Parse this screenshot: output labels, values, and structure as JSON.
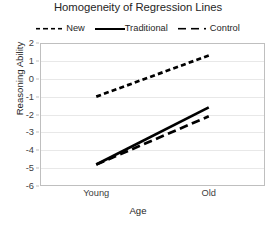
{
  "chart_data": {
    "type": "line",
    "title": "Homogeneity of Regression Lines",
    "xlabel": "Age",
    "ylabel": "Reasoning Ability",
    "categories": [
      "Young",
      "Old"
    ],
    "ylim": [
      -6,
      2
    ],
    "ytick_labels": [
      "2",
      "1",
      "0",
      "-1",
      "-2",
      "-3",
      "-4",
      "-5",
      "-6"
    ],
    "ytick_values": [
      2,
      1,
      0,
      -1,
      -2,
      -3,
      -4,
      -5,
      -6
    ],
    "grid": "horizontal",
    "legend_position": "top",
    "series": [
      {
        "name": "New",
        "values": [
          -1.0,
          1.3
        ],
        "style": "dashed-short",
        "color": "#000000"
      },
      {
        "name": "Traditional",
        "values": [
          -4.8,
          -1.6
        ],
        "style": "solid",
        "color": "#000000"
      },
      {
        "name": "Control",
        "values": [
          -4.8,
          -2.1
        ],
        "style": "dashed-long",
        "color": "#000000"
      }
    ]
  },
  "chart": {
    "title": "Homogeneity of Regression Lines",
    "xlabel": "Age",
    "ylabel": "Reasoning Ability"
  },
  "legend": {
    "entries": [
      {
        "label": "New",
        "swatch": "dashed-short-line-icon"
      },
      {
        "label": "Traditional",
        "swatch": "solid-line-icon"
      },
      {
        "label": "Control",
        "swatch": "dashed-long-line-icon"
      }
    ]
  },
  "axes": {
    "y_ticks": [
      "2",
      "1",
      "0",
      "-1",
      "-2",
      "-3",
      "-4",
      "-5",
      "-6"
    ],
    "x_ticks": [
      "Young",
      "Old"
    ]
  }
}
